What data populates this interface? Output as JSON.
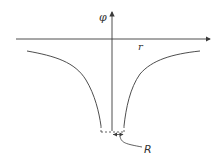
{
  "diagram": {
    "type": "potential-well-plot",
    "axes": {
      "y_label": "φ",
      "x_label": "r"
    },
    "annotations": {
      "radius_label": "R"
    },
    "colors": {
      "line": "#3a3a3a",
      "background": "#ffffff"
    }
  }
}
